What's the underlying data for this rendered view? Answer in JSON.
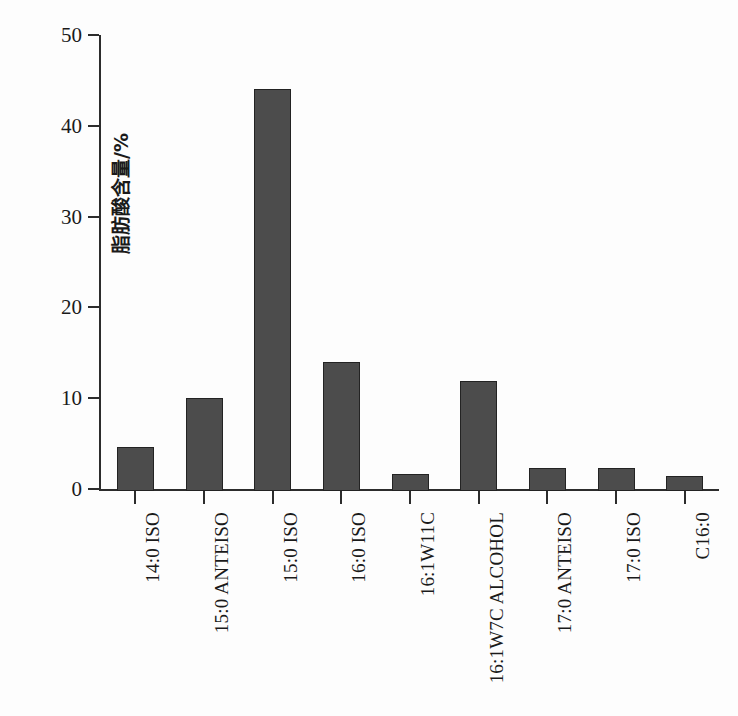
{
  "chart_data": {
    "type": "bar",
    "title": "",
    "subtitle": "",
    "xlabel": "",
    "ylabel": "脂肪酸含量/%",
    "ylim": [
      0,
      50
    ],
    "yticks": [
      0,
      10,
      20,
      30,
      40,
      50
    ],
    "grid": false,
    "legend": null,
    "bar_color": "#4c4c4c",
    "bar_edge_color": "#232323",
    "axis_color": "#2c2c2c",
    "categories": [
      "14:0 ISO",
      "15:0 ANTEISO",
      "15:0 ISO",
      "16:0 ISO",
      "16:1W11C",
      "16:1W7C ALCOHOL",
      "17:0 ANTEISO",
      "17:0 ISO",
      "C16:0"
    ],
    "values": [
      4.9,
      10.2,
      44.3,
      14.2,
      1.9,
      12.1,
      2.5,
      2.5,
      1.6
    ]
  }
}
